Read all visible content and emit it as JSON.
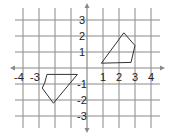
{
  "diagram": {
    "type": "coordinate-grid",
    "x_range": [
      -5,
      4
    ],
    "y_range": [
      -3.75,
      3.75
    ],
    "x_tick_labels": [
      "-4",
      "-3",
      "1",
      "2",
      "3",
      "4"
    ],
    "y_tick_labels": [
      "3",
      "2",
      "1",
      "-1",
      "-2",
      "-3"
    ],
    "grid_color": "#8a8a8a",
    "axis_color": "#8a8a8a",
    "shape_color": "#333333"
  },
  "shapes": [
    {
      "name": "right-quadrilateral",
      "vertices": [
        [
          0.9,
          0.3
        ],
        [
          2.3,
          2.2
        ],
        [
          3.0,
          1.4
        ],
        [
          2.75,
          0.35
        ]
      ]
    },
    {
      "name": "left-pentagon",
      "vertices": [
        [
          -2.5,
          -0.4
        ],
        [
          -0.6,
          -0.4
        ],
        [
          -2.1,
          -2.2
        ],
        [
          -2.8,
          -1.25
        ],
        [
          -2.65,
          -0.95
        ]
      ]
    }
  ]
}
